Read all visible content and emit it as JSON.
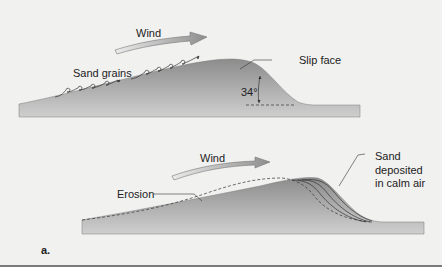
{
  "diagram": {
    "top": {
      "wind_label": "Wind",
      "sand_grains_label": "Sand grains",
      "slip_face_label": "Slip face",
      "angle_label": "34°"
    },
    "bottom": {
      "wind_label": "Wind",
      "erosion_label": "Erosion",
      "deposit_label_line1": "Sand",
      "deposit_label_line2": "deposited",
      "deposit_label_line3": "in calm air"
    },
    "panel_label": "a.",
    "colors": {
      "background": "#f1f1f0",
      "dune_dark": "#8a8a8a",
      "dune_light": "#d4d4d4",
      "arrow": "#9a9a9a",
      "text": "#222222"
    }
  }
}
